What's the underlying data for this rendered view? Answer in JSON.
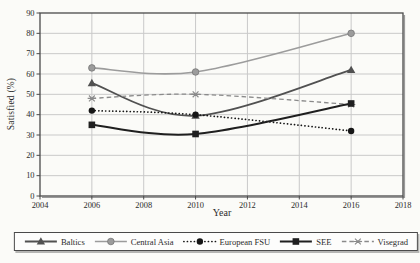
{
  "figure": {
    "background": "#fbfbf8",
    "grid_color": "#c9c9c9",
    "border_color": "#4a4a4a",
    "shadow_color": "#9a9a9a",
    "text_color": "#2b2b2b"
  },
  "chart_data": {
    "type": "line",
    "title": "",
    "xlabel": "Year",
    "ylabel": "Satisfied (%)",
    "x": [
      2006,
      2010,
      2016
    ],
    "xlim": [
      2004,
      2018
    ],
    "ylim": [
      0,
      90
    ],
    "x_ticks": [
      2004,
      2006,
      2008,
      2010,
      2012,
      2014,
      2016,
      2018
    ],
    "y_ticks": [
      0,
      10,
      20,
      30,
      40,
      50,
      60,
      70,
      80,
      90
    ],
    "grid": true,
    "line_style": "smooth",
    "legend_position": "bottom-boxed",
    "series": [
      {
        "name": "Baltics",
        "values": [
          55.5,
          39.5,
          62
        ],
        "color": "#515151",
        "line": "solid",
        "marker": "triangle",
        "width": 1.8
      },
      {
        "name": "Central Asia",
        "values": [
          63,
          61,
          80
        ],
        "color": "#9c9c9c",
        "line": "solid",
        "marker": "circle",
        "width": 1.6
      },
      {
        "name": "European FSU",
        "values": [
          42,
          40,
          32
        ],
        "color": "#161616",
        "line": "dotted",
        "marker": "dot",
        "width": 1.7
      },
      {
        "name": "SEE",
        "values": [
          35,
          30.5,
          45.5
        ],
        "color": "#1f1f1f",
        "line": "solid",
        "marker": "square",
        "width": 2.0
      },
      {
        "name": "Visegrad",
        "values": [
          48,
          50,
          45
        ],
        "color": "#8a8a8a",
        "line": "dashed",
        "marker": "asterisk",
        "width": 1.3
      }
    ],
    "draw_order": [
      0,
      1,
      2,
      4,
      3
    ]
  }
}
